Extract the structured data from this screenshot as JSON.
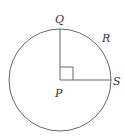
{
  "diagram": {
    "labels": {
      "Q": "Q",
      "R": "R",
      "S": "S",
      "P": "P"
    },
    "center": {
      "x": 60,
      "y": 80
    },
    "radius": 51,
    "stroke_color": "#555555"
  }
}
